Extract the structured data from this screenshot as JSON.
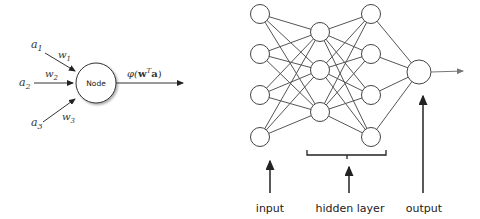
{
  "perceptron": {
    "node_label": "Node",
    "inputs": [
      {
        "name": "a",
        "sub": "1",
        "weight": "w",
        "wsub": "1"
      },
      {
        "name": "a",
        "sub": "2",
        "weight": "w",
        "wsub": "2"
      },
      {
        "name": "a",
        "sub": "3",
        "weight": "w",
        "wsub": "3"
      }
    ],
    "output_label": {
      "phi": "φ(",
      "w": "w",
      "sup": "T",
      "a": "a",
      "close": ")"
    }
  },
  "network": {
    "layers": [
      {
        "name": "input",
        "node_count": 4
      },
      {
        "name": "hidden-1",
        "node_count": 3
      },
      {
        "name": "hidden-2",
        "node_count": 4
      },
      {
        "name": "output",
        "node_count": 1
      }
    ],
    "labels": {
      "input": "input",
      "hidden": "hidden layer",
      "output": "output"
    }
  },
  "colors": {
    "line": "#555555",
    "circle_stroke": "#444444",
    "arrow": "#222222"
  }
}
